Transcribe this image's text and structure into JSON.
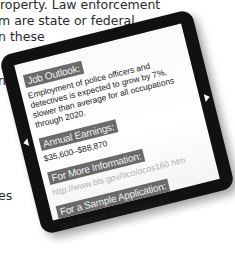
{
  "background_text": {
    "lines": [
      "property. Law enforcement",
      "m are state or federal",
      "n these",
      "n",
      "es"
    ]
  },
  "tablet": {
    "sections": [
      {
        "label": "Job Outlook:",
        "text": "Employment of police officers and detectives is expected to grow by 7%, slower than average for all occupations through 2020."
      },
      {
        "label": "Annual Earnings:",
        "text": "$35,600–$88,870"
      },
      {
        "label": "For More Information:",
        "text": "http://www.bls.gov/oco/ocos160.htm"
      },
      {
        "label": "For a Sample Application:",
        "text": "See Problem 89 in Section 8.1."
      }
    ],
    "icons": {
      "left": "arrow-left-icon",
      "right": "arrow-right-icon"
    },
    "colors": {
      "bezel": "#111111",
      "label_bg": "#6a6a6a",
      "link": "#b0b0b0"
    }
  }
}
